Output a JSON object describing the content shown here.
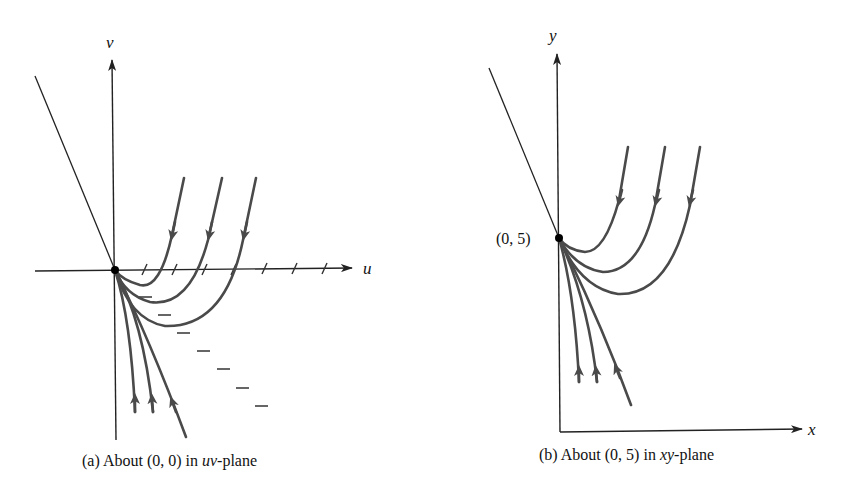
{
  "figure": {
    "panel_a": {
      "caption_prefix": "(a) About (0, 0) in ",
      "caption_ital": "uv",
      "caption_suffix": "-plane",
      "horizontal_axis_label": "u",
      "vertical_axis_label": "v",
      "equilibrium_point": "(0, 0)",
      "tick_count_on_u_axis": 7,
      "dash_count_below": 7
    },
    "panel_b": {
      "caption_prefix": "(b) About (0, 5) in ",
      "caption_ital": "xy",
      "caption_suffix": "-plane",
      "horizontal_axis_label": "x",
      "vertical_axis_label": "y",
      "equilibrium_point_label": "(0, 5)"
    }
  },
  "colors": {
    "axis": "#222222",
    "trajectory": "#4a4a4a",
    "background": "#ffffff"
  }
}
